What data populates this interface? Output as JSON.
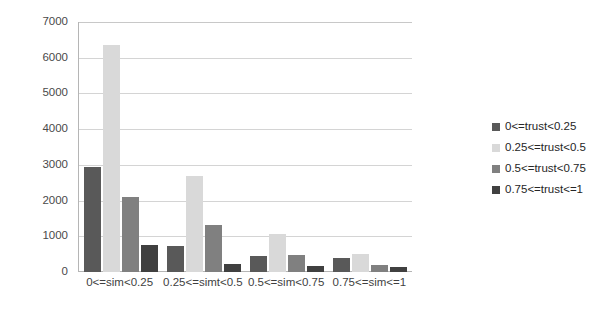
{
  "chart_data": {
    "type": "bar",
    "title": "",
    "xlabel": "",
    "ylabel": "",
    "ylim": [
      0,
      7000
    ],
    "ytick_labels": [
      "7000",
      "6000",
      "5000",
      "4000",
      "3000",
      "2000",
      "1000",
      "0"
    ],
    "ytick_values": [
      7000,
      6000,
      5000,
      4000,
      3000,
      2000,
      1000,
      0
    ],
    "grid": true,
    "legend_position": "right",
    "categories": [
      "0<=sim<0.25",
      "0.25<=simt<0.5",
      "0.5<=sim<0.75",
      "0.75<=sim<=1"
    ],
    "series": [
      {
        "name": "0<=trust<0.25",
        "color": "#595959",
        "values": [
          2930,
          715,
          460,
          400
        ]
      },
      {
        "name": "0.25<=trust<0.5",
        "color": "#d9d9d9",
        "values": [
          6360,
          2680,
          1060,
          500
        ]
      },
      {
        "name": "0.5<=trust<0.75",
        "color": "#808080",
        "values": [
          2090,
          1330,
          490,
          190
        ]
      },
      {
        "name": "0.75<=trust<=1",
        "color": "#404040",
        "values": [
          760,
          215,
          175,
          150
        ]
      }
    ]
  }
}
